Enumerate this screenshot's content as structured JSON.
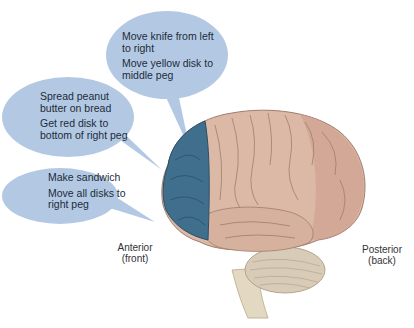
{
  "figure": {
    "title": "",
    "colors": {
      "bubble": "#b3c9e3",
      "prefrontal": "#3f6f8c",
      "cortex": "#dcb9a6",
      "cortex_posterior": "#cc9a8a",
      "cerebellum": "#d8cbb7",
      "brainstem": "#e3d8c2"
    },
    "bubbles": [
      {
        "id": "top",
        "lines": [
          "Move knife from left to right",
          "Move yellow disk to middle peg"
        ]
      },
      {
        "id": "middle",
        "lines": [
          "Spread peanut butter on bread",
          "Get red disk to bottom of right peg"
        ]
      },
      {
        "id": "bottom",
        "lines": [
          "Make sandwich",
          "Move all disks to right peg"
        ]
      }
    ],
    "labels": {
      "anterior": "Anterior",
      "anterior_sub": "(front)",
      "posterior": "Posterior",
      "posterior_sub": "(back)"
    }
  }
}
